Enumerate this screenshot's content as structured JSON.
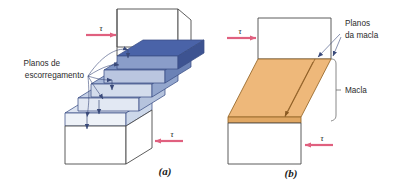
{
  "figure": {
    "background_color": "#ffffff",
    "panels": [
      {
        "id": "a",
        "caption": "(a)",
        "mechanism": "slip",
        "label": {
          "line1": "Planos de",
          "line2": "escorregamento",
          "name": "slip-planes-label"
        },
        "shear_top": {
          "symbol": "τ",
          "direction": "right"
        },
        "shear_bottom": {
          "symbol": "τ",
          "direction": "left"
        },
        "slab_colors": [
          "#4a63a8",
          "#7d93c4",
          "#a8b8d9",
          "#c6d1e6",
          "#dde4f1"
        ],
        "outline_color": "#4a4a4a",
        "slab_edge_color": "#3b4f86",
        "leader_color": "#3a4a7a",
        "slab_count": 5
      },
      {
        "id": "b",
        "caption": "(b)",
        "mechanism": "twinning",
        "label": {
          "line1": "Planos",
          "line2": "da macla",
          "name": "twin-planes-label"
        },
        "region_label": "Macla",
        "shear_top": {
          "symbol": "τ",
          "direction": "right"
        },
        "shear_bottom": {
          "symbol": "τ",
          "direction": "left"
        },
        "twin_fill_color": "#eeb87a",
        "twin_edge_color": "#9a6b2e",
        "outline_color": "#4a4a4a",
        "bracket_color": "#6b6b6b",
        "leader_color": "#3a4a7a"
      }
    ],
    "shear_arrow_color": "#e0607f",
    "text_color": "#2b2b2b"
  }
}
